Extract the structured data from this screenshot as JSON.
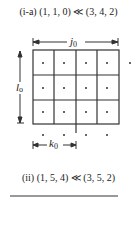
{
  "captions": {
    "top": "(i-a)  (1,  1,  0) ≪ (3,  4,  2)",
    "bottom": "(ii)  (1,  5,  4) ≪ (3,  5,  2)"
  },
  "labels": {
    "j": "j",
    "j_sub": "0",
    "l": "l",
    "l_sub": "0",
    "k": "k",
    "k_sub": "0"
  },
  "grid": {
    "columns": 4,
    "rows": 3,
    "line_color": "#333333",
    "dot_color": "#333333"
  }
}
